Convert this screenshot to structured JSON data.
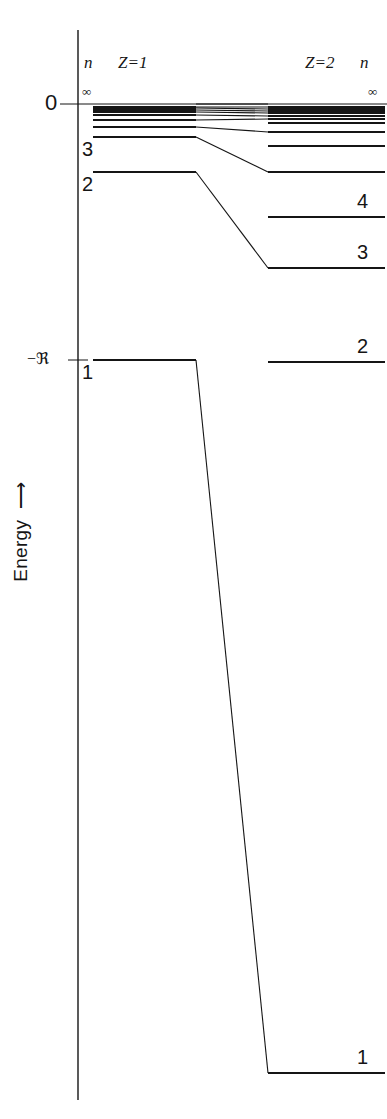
{
  "figure": {
    "axis_label": "Energy",
    "axis_arrow": "up-arrow",
    "line_color": "#151515",
    "background": "#ffffff"
  },
  "axis": {
    "ticks": [
      {
        "label": "0",
        "value": 0,
        "y": 104
      },
      {
        "label": "−ℜ",
        "value": -1,
        "y": 360
      }
    ],
    "zero_line_label": "0",
    "rydberg_label": "−ℜ"
  },
  "columns": {
    "left": {
      "charge_label": "Z=1",
      "quantum_number_header": "n",
      "x_start": 93,
      "x_end": 196
    },
    "right": {
      "charge_label": "Z=2",
      "quantum_number_header": "n",
      "x_start": 268,
      "x_end": 385
    }
  },
  "chart_data": {
    "type": "line",
    "xlabel": "",
    "ylabel": "Energy",
    "ylim": [
      -4,
      0
    ],
    "grid": false,
    "legend": "none",
    "formula": "E = -ℜ Z² / n²",
    "units": "Rydberg (ℜ)",
    "series": [
      {
        "name": "Z=1",
        "charge_label": "Z=1",
        "levels": [
          {
            "n": "∞",
            "energy": 0.0,
            "y": 104,
            "label": "∞",
            "label_shown": true,
            "label_pos": "left"
          },
          {
            "n": 10,
            "energy": -0.01,
            "y": 107,
            "label": "",
            "label_shown": false
          },
          {
            "n": 9,
            "energy": -0.0123,
            "y": 108,
            "label": "",
            "label_shown": false
          },
          {
            "n": 8,
            "energy": -0.0156,
            "y": 110,
            "label": "",
            "label_shown": false
          },
          {
            "n": 7,
            "energy": -0.0204,
            "y": 112,
            "label": "",
            "label_shown": false
          },
          {
            "n": 6,
            "energy": -0.0278,
            "y": 115,
            "label": "",
            "label_shown": false
          },
          {
            "n": 5,
            "energy": -0.04,
            "y": 120,
            "label": "",
            "label_shown": false
          },
          {
            "n": 4,
            "energy": -0.0625,
            "y": 127,
            "label": "",
            "label_shown": false
          },
          {
            "n": 3,
            "energy": -0.1111,
            "y": 137,
            "label": "3",
            "label_shown": true,
            "label_pos": "left"
          },
          {
            "n": 2,
            "energy": -0.25,
            "y": 172,
            "label": "2",
            "label_shown": true,
            "label_pos": "left"
          },
          {
            "n": 1,
            "energy": -1.0,
            "y": 360,
            "label": "1",
            "label_shown": true,
            "label_pos": "left"
          }
        ]
      },
      {
        "name": "Z=2",
        "charge_label": "Z=2",
        "levels": [
          {
            "n": "∞",
            "energy": 0.0,
            "y": 104,
            "label": "∞",
            "label_shown": true,
            "label_pos": "right"
          },
          {
            "n": 14,
            "energy": -0.0204,
            "y": 107,
            "label": "",
            "label_shown": false
          },
          {
            "n": 13,
            "energy": -0.0237,
            "y": 109,
            "label": "",
            "label_shown": false
          },
          {
            "n": 12,
            "energy": -0.0278,
            "y": 111,
            "label": "",
            "label_shown": false
          },
          {
            "n": 11,
            "energy": -0.0331,
            "y": 113,
            "label": "",
            "label_shown": false
          },
          {
            "n": 10,
            "energy": -0.04,
            "y": 116,
            "label": "",
            "label_shown": false
          },
          {
            "n": 9,
            "energy": -0.0494,
            "y": 119,
            "label": "",
            "label_shown": false
          },
          {
            "n": 8,
            "energy": -0.0625,
            "y": 123,
            "label": "",
            "label_shown": false
          },
          {
            "n": 7,
            "energy": -0.0816,
            "y": 132,
            "label": "",
            "label_shown": false
          },
          {
            "n": 6,
            "energy": -0.1111,
            "y": 146,
            "label": "",
            "label_shown": false
          },
          {
            "n": 5,
            "energy": -0.16,
            "y": 172,
            "label": "",
            "label_shown": false
          },
          {
            "n": 4,
            "energy": -0.25,
            "y": 217,
            "label": "4",
            "label_shown": true,
            "label_pos": "right"
          },
          {
            "n": 3,
            "energy": -0.4444,
            "y": 268,
            "label": "3",
            "label_shown": true,
            "label_pos": "right"
          },
          {
            "n": 2,
            "energy": -1.0,
            "y": 362,
            "label": "2",
            "label_shown": true,
            "label_pos": "right"
          },
          {
            "n": 1,
            "energy": -4.0,
            "y": 1073,
            "label": "1",
            "label_shown": true,
            "label_pos": "right"
          }
        ]
      }
    ],
    "correlations": [
      {
        "from_index": 0,
        "to_index": 0
      },
      {
        "from_index": 1,
        "to_index": 1
      },
      {
        "from_index": 2,
        "to_index": 2
      },
      {
        "from_index": 3,
        "to_index": 3
      },
      {
        "from_index": 4,
        "to_index": 4
      },
      {
        "from_index": 5,
        "to_index": 5
      },
      {
        "from_index": 6,
        "to_index": 6
      },
      {
        "from_index": 7,
        "to_index": 8
      },
      {
        "from_index": 8,
        "to_index": 10
      },
      {
        "from_index": 9,
        "to_index": 12
      },
      {
        "from_index": 10,
        "to_index": 14
      }
    ]
  }
}
